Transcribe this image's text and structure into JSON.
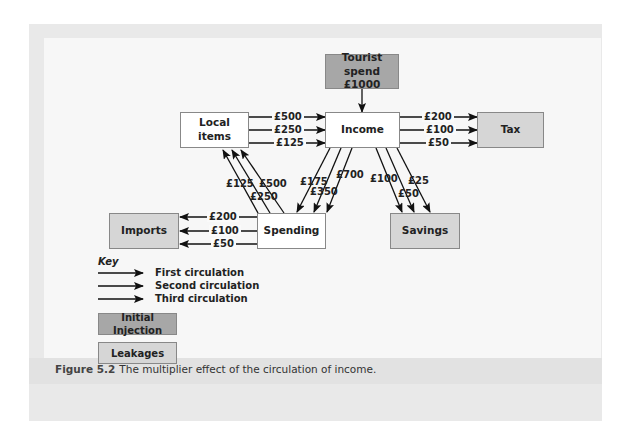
{
  "diagram": {
    "nodes": {
      "tourist_spend": {
        "line1": "Tourist spend",
        "line2": "£1000",
        "type": "initial-injection"
      },
      "local_items": {
        "label": "Local items",
        "type": "plain"
      },
      "income": {
        "label": "Income",
        "type": "plain"
      },
      "tax": {
        "label": "Tax",
        "type": "leakage"
      },
      "imports": {
        "label": "Imports",
        "type": "leakage"
      },
      "spending": {
        "label": "Spending",
        "type": "plain"
      },
      "savings": {
        "label": "Savings",
        "type": "leakage"
      }
    },
    "flows": {
      "local_to_income": [
        "£500",
        "£250",
        "£125"
      ],
      "income_to_tax": [
        "£200",
        "£100",
        "£50"
      ],
      "spending_to_imports": [
        "£200",
        "£100",
        "£50"
      ],
      "spending_to_local": [
        "£500",
        "£250",
        "£125"
      ],
      "income_to_spending": [
        "£700",
        "£350",
        "£175"
      ],
      "income_to_savings": [
        "£100",
        "£50",
        "£25"
      ]
    },
    "key": {
      "title": "Key",
      "lines": [
        "First circulation",
        "Second circulation",
        "Third circulation"
      ],
      "swatches": [
        "Initial Injection",
        "Leakages"
      ]
    },
    "colors": {
      "initial_injection": "#a7a7a7",
      "leakage": "#d6d6d6",
      "plain": "#ffffff"
    }
  },
  "caption": {
    "figure_label": "Figure 5.2",
    "text": "The multiplier effect of the circulation of income."
  }
}
